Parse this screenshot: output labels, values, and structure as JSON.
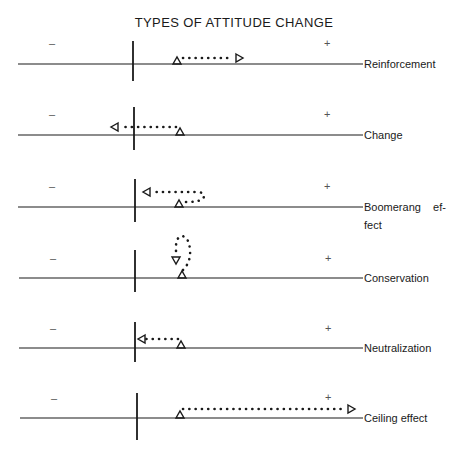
{
  "title": "TYPES OF ATTITUDE CHANGE",
  "signs": {
    "negative": "–",
    "positive": "+"
  },
  "colors": {
    "ink": "#1a1a1a",
    "background": "#ffffff"
  },
  "rows": [
    {
      "label": "Reinforcement",
      "label2": ""
    },
    {
      "label": "Change",
      "label2": ""
    },
    {
      "label": "Boomerang    ef-",
      "label2": "fect"
    },
    {
      "label": "Conservation",
      "label2": ""
    },
    {
      "label": "Neutralization",
      "label2": ""
    },
    {
      "label": "Ceiling effect",
      "label2": ""
    }
  ],
  "legend_semantics": {
    "start_marker": "open-triangle-up",
    "end_marker": "open-arrowhead",
    "path": "dotted"
  }
}
